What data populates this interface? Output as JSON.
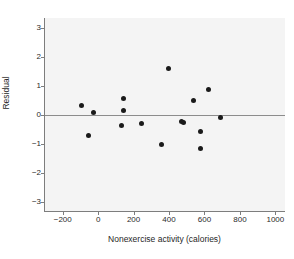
{
  "chart_data": {
    "type": "scatter",
    "title": "",
    "xlabel": "Nonexercise activity (calories)",
    "ylabel": "Residual",
    "xlim": [
      -300,
      1060
    ],
    "ylim": [
      -3.35,
      3.35
    ],
    "xticks": [
      -200,
      0,
      200,
      400,
      600,
      800,
      1000
    ],
    "xtick_labels": [
      "−200",
      "0",
      "200",
      "400",
      "600",
      "800",
      "1000"
    ],
    "yticks": [
      3,
      2,
      1,
      0,
      -1,
      -2,
      -3
    ],
    "ytick_labels": [
      "3",
      "2",
      "1",
      "0",
      "−1",
      "−2",
      "−3"
    ],
    "grid": false,
    "legend": null,
    "reference_line": {
      "y": 0,
      "color": "#8c8c8c"
    },
    "marker": {
      "shape": "circle",
      "color": "#1a1a1a",
      "size": 5
    },
    "points": [
      {
        "x": -94,
        "y": 0.34
      },
      {
        "x": -57,
        "y": -0.72
      },
      {
        "x": -24,
        "y": 0.07
      },
      {
        "x": 144,
        "y": 0.58
      },
      {
        "x": 143,
        "y": 0.16
      },
      {
        "x": 134,
        "y": -0.35
      },
      {
        "x": 245,
        "y": -0.29
      },
      {
        "x": 359,
        "y": -1.02
      },
      {
        "x": 397,
        "y": 1.62
      },
      {
        "x": 473,
        "y": -0.24
      },
      {
        "x": 481,
        "y": -0.27
      },
      {
        "x": 538,
        "y": 0.49
      },
      {
        "x": 578,
        "y": -0.58
      },
      {
        "x": 580,
        "y": -1.15
      },
      {
        "x": 620,
        "y": 0.89
      },
      {
        "x": 690,
        "y": -0.08
      }
    ]
  }
}
